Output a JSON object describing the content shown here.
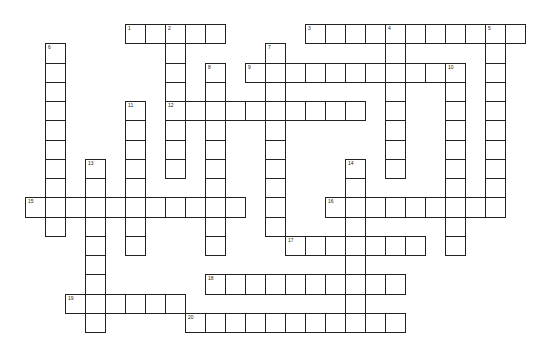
{
  "puzzle": {
    "grid": {
      "origin_x": 5,
      "origin_y": 24,
      "cell_w": 20,
      "cell_h": 19.25,
      "line_color": "#222222",
      "fill_color": "#ffffff"
    },
    "across": [
      {
        "number": 1,
        "row": 0,
        "col": 6,
        "length": 5
      },
      {
        "number": 3,
        "row": 0,
        "col": 15,
        "length": 11
      },
      {
        "number": 9,
        "row": 2,
        "col": 12,
        "length": 11
      },
      {
        "number": 12,
        "row": 4,
        "col": 8,
        "length": 10
      },
      {
        "number": 15,
        "row": 9,
        "col": 1,
        "length": 11
      },
      {
        "number": 16,
        "row": 9,
        "col": 16,
        "length": 9
      },
      {
        "number": 17,
        "row": 11,
        "col": 14,
        "length": 7
      },
      {
        "number": 18,
        "row": 13,
        "col": 10,
        "length": 10
      },
      {
        "number": 19,
        "row": 14,
        "col": 3,
        "length": 6
      },
      {
        "number": 20,
        "row": 15,
        "col": 9,
        "length": 11
      }
    ],
    "down": [
      {
        "number": 2,
        "row": 0,
        "col": 8,
        "length": 8
      },
      {
        "number": 4,
        "row": 0,
        "col": 19,
        "length": 8
      },
      {
        "number": 5,
        "row": 0,
        "col": 24,
        "length": 10
      },
      {
        "number": 6,
        "row": 1,
        "col": 2,
        "length": 10
      },
      {
        "number": 7,
        "row": 1,
        "col": 13,
        "length": 10
      },
      {
        "number": 8,
        "row": 2,
        "col": 10,
        "length": 10
      },
      {
        "number": 10,
        "row": 2,
        "col": 22,
        "length": 10
      },
      {
        "number": 11,
        "row": 4,
        "col": 6,
        "length": 8
      },
      {
        "number": 13,
        "row": 7,
        "col": 4,
        "length": 9
      },
      {
        "number": 14,
        "row": 7,
        "col": 17,
        "length": 9
      }
    ]
  }
}
